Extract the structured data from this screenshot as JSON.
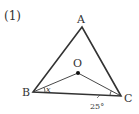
{
  "problem_label": "(1)",
  "vertices": {
    "A": {
      "label": "A",
      "x": 82,
      "y": 27
    },
    "B": {
      "label": "B",
      "x": 33,
      "y": 92
    },
    "C": {
      "label": "C",
      "x": 121,
      "y": 96
    },
    "O": {
      "label": "O",
      "x": 78,
      "y": 73
    }
  },
  "angles": {
    "at_B": {
      "label": "x",
      "between": [
        "BC",
        "BO"
      ]
    },
    "at_C": {
      "label": "25°",
      "between": [
        "CB",
        "CO"
      ]
    }
  },
  "colors": {
    "stroke": "#333333",
    "text": "#333333"
  }
}
